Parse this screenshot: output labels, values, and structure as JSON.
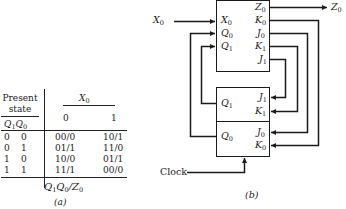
{
  "panel_a": {
    "caption": "(a)",
    "header": {
      "present_state_line1": "Present",
      "present_state_line2": "state",
      "state_vars": [
        "Q",
        "1",
        "Q",
        "0"
      ],
      "input_var": "X",
      "input_sub": "0",
      "input_values": [
        "0",
        "1"
      ]
    },
    "rows": [
      {
        "q1": "0",
        "q0": "0",
        "x0": "00/0",
        "x1": "10/1"
      },
      {
        "q1": "0",
        "q0": "1",
        "x0": "01/1",
        "x1": "11/0"
      },
      {
        "q1": "1",
        "q0": "0",
        "x0": "10/0",
        "x1": "01/1"
      },
      {
        "q1": "1",
        "q0": "1",
        "x0": "11/1",
        "x1": "00/0"
      }
    ],
    "footer": {
      "parts": [
        "Q",
        "1",
        "Q",
        "0",
        "/Z",
        "0"
      ]
    }
  },
  "panel_b": {
    "caption": "(b)",
    "external_input": {
      "name": "X",
      "sub": "0"
    },
    "external_output": {
      "name": "Z",
      "sub": "0"
    },
    "clock_label": "Clock",
    "logic_block": {
      "inputs": [
        {
          "name": "X",
          "sub": "0"
        },
        {
          "name": "Q",
          "sub": "0"
        },
        {
          "name": "Q",
          "sub": "1"
        }
      ],
      "outputs": [
        {
          "name": "Z",
          "sub": "0"
        },
        {
          "name": "K",
          "sub": "0"
        },
        {
          "name": "J",
          "sub": "0"
        },
        {
          "name": "K",
          "sub": "1"
        },
        {
          "name": "J",
          "sub": "1"
        }
      ]
    },
    "flipflop_1": {
      "output": {
        "name": "Q",
        "sub": "1"
      },
      "inputs": [
        {
          "name": "J",
          "sub": "1"
        },
        {
          "name": "K",
          "sub": "1"
        }
      ]
    },
    "flipflop_0": {
      "output": {
        "name": "Q",
        "sub": "0"
      },
      "inputs": [
        {
          "name": "J",
          "sub": "0"
        },
        {
          "name": "K",
          "sub": "0"
        }
      ]
    }
  }
}
